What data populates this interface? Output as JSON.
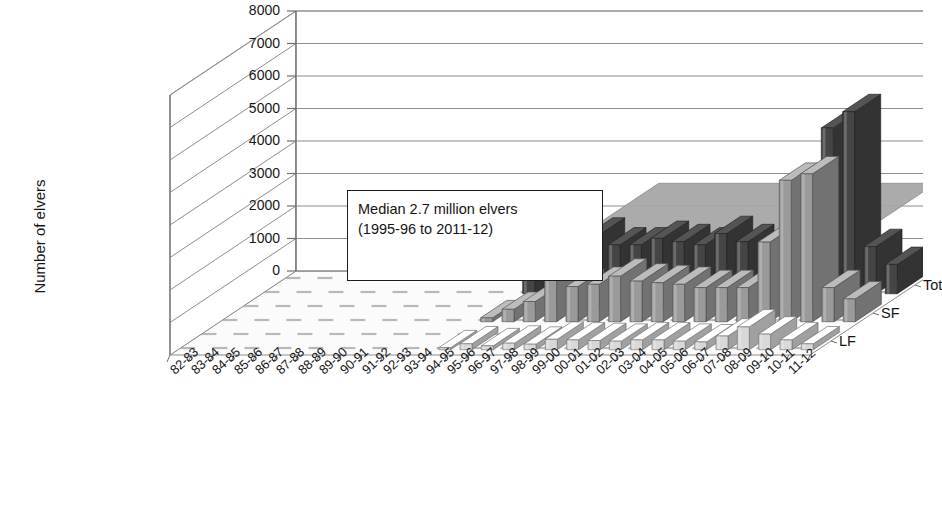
{
  "chart_data": {
    "type": "bar",
    "title": "Elver catches 1982–2012",
    "subtitle": "Main sites",
    "xlabel": "",
    "ylabel": "Number of elvers",
    "ylim": [
      0,
      8000
    ],
    "yticks": [
      "0",
      "1000",
      "2000",
      "3000",
      "4000",
      "5000",
      "6000",
      "7000",
      "8000"
    ],
    "grid": true,
    "legend_position": "top-right",
    "three_d": true,
    "depth_axis_labels": [
      "Tot",
      "SF",
      "LF"
    ],
    "annotation": {
      "line1": "Median 2.7 million elvers",
      "line2": "(1995-96 to 2011-12)"
    },
    "median_band_value": 2700,
    "median_band_start_category": "99-00",
    "categories": [
      "82-83",
      "83-84",
      "84-85",
      "85-86",
      "86-87",
      "87-88",
      "88-89",
      "89-90",
      "90-91",
      "91-92",
      "92-93",
      "93-94",
      "94-95",
      "95-96",
      "96-97",
      "97-98",
      "98-99",
      "99-00",
      "00-01",
      "01-02",
      "02-03",
      "03-04",
      "04-05",
      "05-06",
      "06-07",
      "07-08",
      "08-09",
      "09-10",
      "10-11",
      "11-12"
    ],
    "series": [
      {
        "name": "LF",
        "color": "#d8d8d8",
        "values": [
          0,
          0,
          0,
          0,
          0,
          0,
          0,
          0,
          0,
          0,
          0,
          0,
          60,
          180,
          120,
          200,
          170,
          320,
          300,
          280,
          260,
          300,
          300,
          260,
          240,
          420,
          700,
          480,
          300,
          180
        ]
      },
      {
        "name": "SF",
        "color": "#9a9a9a",
        "values": [
          0,
          0,
          0,
          0,
          0,
          0,
          0,
          0,
          0,
          0,
          0,
          0,
          120,
          380,
          620,
          1350,
          1080,
          1150,
          1400,
          1250,
          1200,
          1150,
          1050,
          1050,
          1050,
          2450,
          4350,
          4550,
          1050,
          700
        ]
      },
      {
        "name": "Total",
        "color": "#454545",
        "values": [
          0,
          0,
          0,
          0,
          0,
          0,
          0,
          0,
          0,
          0,
          0,
          0,
          600,
          520,
          1000,
          1800,
          1500,
          1500,
          1700,
          1600,
          1500,
          1850,
          1600,
          1450,
          1450,
          2900,
          5100,
          5600,
          1450,
          900
        ]
      }
    ]
  }
}
